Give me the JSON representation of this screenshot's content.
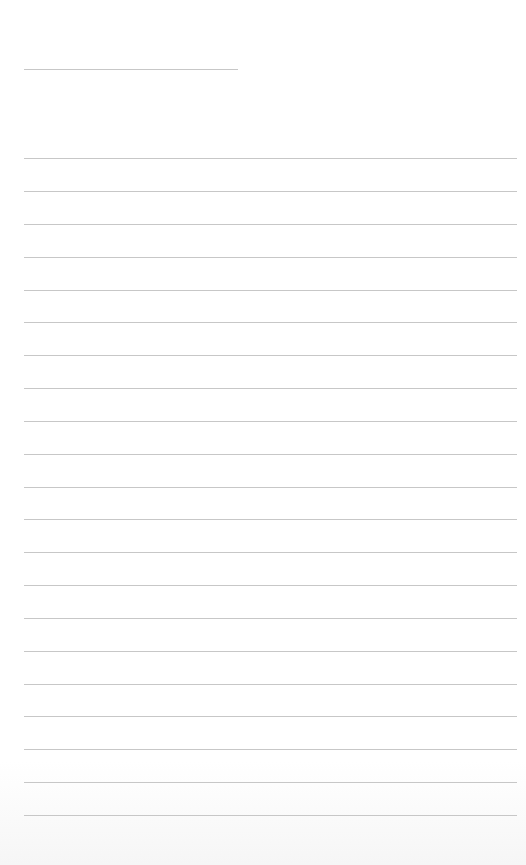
{
  "page": {
    "type": "lined-paper",
    "background_color": "#ffffff",
    "line_color": "#bdbdbd"
  },
  "header_line": {
    "top": 69,
    "left": 24,
    "width": 214
  },
  "lines": [
    {
      "top": 158
    },
    {
      "top": 191
    },
    {
      "top": 224
    },
    {
      "top": 257
    },
    {
      "top": 290
    },
    {
      "top": 322
    },
    {
      "top": 355
    },
    {
      "top": 388
    },
    {
      "top": 421
    },
    {
      "top": 454
    },
    {
      "top": 487
    },
    {
      "top": 519
    },
    {
      "top": 552
    },
    {
      "top": 585
    },
    {
      "top": 618
    },
    {
      "top": 651
    },
    {
      "top": 684
    },
    {
      "top": 716
    },
    {
      "top": 749
    },
    {
      "top": 782
    },
    {
      "top": 815
    }
  ]
}
